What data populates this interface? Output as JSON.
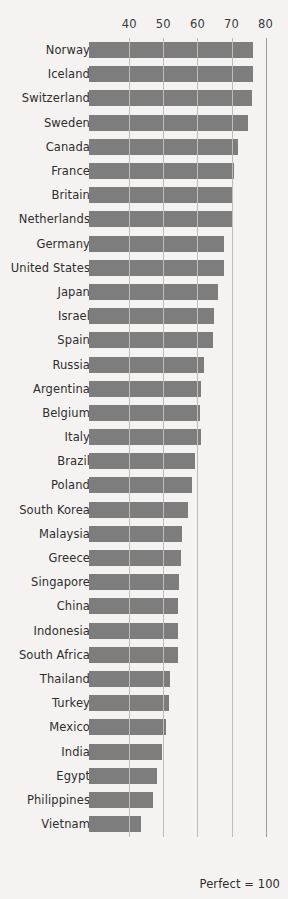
{
  "chart_data": {
    "type": "bar",
    "orientation": "horizontal",
    "title": "",
    "subtitle": "",
    "xlabel": "",
    "ylabel": "",
    "footnote": "Perfect = 100",
    "grid": true,
    "legend": "none",
    "xlim": [
      28.2,
      80
    ],
    "xticks": [
      40,
      50,
      60,
      70,
      80
    ],
    "xtick_labels": [
      "40",
      "50",
      "60",
      "70",
      "80"
    ],
    "categories": [
      "Norway",
      "Iceland",
      "Switzerland",
      "Sweden",
      "Canada",
      "France",
      "Britain",
      "Netherlands",
      "Germany",
      "United States",
      "Japan",
      "Israel",
      "Spain",
      "Russia",
      "Argentina",
      "Belgium",
      "Italy",
      "Brazil",
      "Poland",
      "South Korea",
      "Malaysia",
      "Greece",
      "Singapore",
      "China",
      "Indonesia",
      "South Africa",
      "Thailand",
      "Turkey",
      "Mexico",
      "India",
      "Egypt",
      "Philippines",
      "Vietnam"
    ],
    "values": [
      76.2,
      76.2,
      76.1,
      74.9,
      72.0,
      70.6,
      70.1,
      70.1,
      67.8,
      67.8,
      66.1,
      65.0,
      64.7,
      62.0,
      61.0,
      60.7,
      61.0,
      59.3,
      58.3,
      57.3,
      55.5,
      55.1,
      54.7,
      54.4,
      54.4,
      54.4,
      52.1,
      51.7,
      50.7,
      49.6,
      48.1,
      47.0,
      43.5
    ],
    "series_name": "Score",
    "bar_color": "#7d7d7d",
    "background_color": "#f4f3f1",
    "gridline_color": "#bdbcba"
  }
}
